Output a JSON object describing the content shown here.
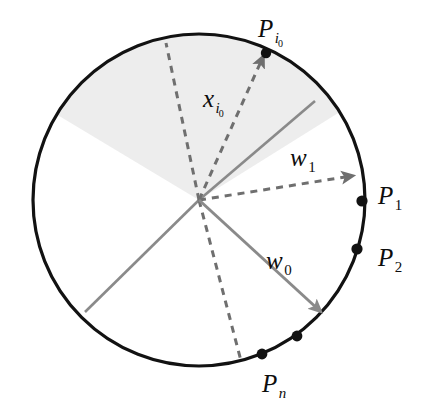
{
  "figure": {
    "background_color": "#ffffff",
    "circle": {
      "center_x": 199,
      "center_y": 200,
      "radius": 166,
      "stroke_color": "#121212",
      "stroke_width": 3.2,
      "fill_color": "#ffffff"
    },
    "shaded_sector": {
      "fill_color": "#ededed",
      "start_angle_deg": 211,
      "end_angle_deg": 328,
      "description": "shaded region spanning the left portion of the disc"
    }
  },
  "sector_lines": [
    {
      "name": "sector-boundary-upper",
      "color": "#8a8a8a",
      "width": 2.6,
      "x1": 199,
      "y1": 200,
      "x2": 315,
      "y2": 101,
      "style": "solid"
    },
    {
      "name": "sector-boundary-lower",
      "color": "#8a8a8a",
      "width": 2.6,
      "x1": 199,
      "y1": 200,
      "x2": 85,
      "y2": 312,
      "style": "solid"
    }
  ],
  "dashed_rays": [
    {
      "name": "dashed-ray-upper-left",
      "color": "#6f6f6f",
      "width": 3.0,
      "x1": 199,
      "y1": 200,
      "x2": 166,
      "y2": 43,
      "style": "dashed",
      "arrowhead": false
    },
    {
      "name": "dashed-ray-xi0",
      "color": "#6f6f6f",
      "width": 3.0,
      "x1": 199,
      "y1": 200,
      "x2": 263,
      "y2": 57,
      "style": "dashed",
      "arrowhead": true
    },
    {
      "name": "dashed-ray-w1",
      "color": "#6f6f6f",
      "width": 3.0,
      "x1": 199,
      "y1": 200,
      "x2": 352,
      "y2": 176,
      "style": "dashed",
      "arrowhead": true
    },
    {
      "name": "dashed-ray-lower",
      "color": "#6f6f6f",
      "width": 3.0,
      "x1": 199,
      "y1": 200,
      "x2": 241,
      "y2": 361,
      "style": "dashed",
      "arrowhead": false
    }
  ],
  "solid_vectors": [
    {
      "name": "vector-w0",
      "color": "#8a8a8a",
      "width": 3.0,
      "x1": 199,
      "y1": 200,
      "x2": 320,
      "y2": 311,
      "style": "solid",
      "arrowhead": true
    }
  ],
  "boundary_points": [
    {
      "name": "point-pi0",
      "x": 266,
      "y": 53,
      "r": 5.2,
      "color": "#121212"
    },
    {
      "name": "point-p1",
      "x": 362,
      "y": 201,
      "r": 5.6,
      "color": "#121212"
    },
    {
      "name": "point-p2",
      "x": 357,
      "y": 249,
      "r": 5.6,
      "color": "#121212"
    },
    {
      "name": "point-pn-upper",
      "x": 297,
      "y": 336,
      "r": 5.4,
      "color": "#121212"
    },
    {
      "name": "point-pn-lower",
      "x": 262,
      "y": 354,
      "r": 5.4,
      "color": "#121212"
    }
  ],
  "labels": {
    "p_i0": {
      "base": "P",
      "sub": "i",
      "subsub": "0"
    },
    "x_i0": {
      "base": "x",
      "sub": "i",
      "subsub": "0"
    },
    "w_1": {
      "base": "w",
      "sub": "1"
    },
    "w_0": {
      "base": "w",
      "sub": "0"
    },
    "p_1": {
      "base": "P",
      "sub": "1"
    },
    "p_2": {
      "base": "P",
      "sub": "2"
    },
    "p_n": {
      "base": "P",
      "sub": "n"
    }
  },
  "colors": {
    "circle_stroke": "#121212",
    "sector_fill": "#ededed",
    "gray_line": "#8a8a8a",
    "dashed_line": "#6f6f6f",
    "dot_fill": "#121212",
    "text": "#0d0d0d"
  }
}
